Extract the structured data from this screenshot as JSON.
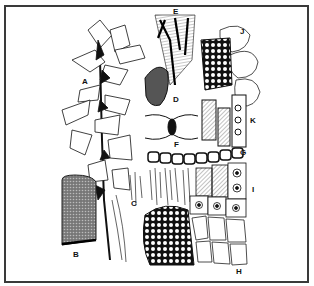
{
  "figure": {
    "type": "botanical illustration plate",
    "border_color": "#3a3a3a",
    "ink_color": "#111111",
    "panels": [
      {
        "id": "A",
        "label": "A",
        "description": "leafy moss shoot"
      },
      {
        "id": "B",
        "label": "B",
        "description": "capsule / cylindrical structure with reticulate surface"
      },
      {
        "id": "C",
        "label": "C",
        "description": "rhizoids / filaments"
      },
      {
        "id": "D",
        "label": "D",
        "description": "single leaf, shaded"
      },
      {
        "id": "E",
        "label": "E",
        "description": "leaf tip with elongated cells"
      },
      {
        "id": "F",
        "label": "F",
        "description": "cell wall junction detail"
      },
      {
        "id": "G",
        "label": "G",
        "description": "row of cells in cross-section"
      },
      {
        "id": "H",
        "label": "H",
        "description": "areolation of leaf base cells"
      },
      {
        "id": "I",
        "label": "I",
        "description": "cells with papillae"
      },
      {
        "id": "J",
        "label": "J",
        "description": "large bulging cells with reticulate network"
      },
      {
        "id": "K",
        "label": "K",
        "description": "elongated cells with hatched walls"
      }
    ]
  }
}
